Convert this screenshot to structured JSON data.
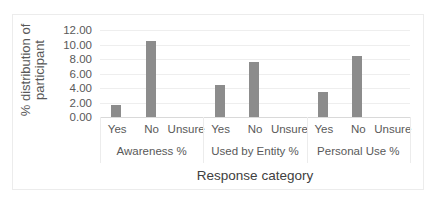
{
  "chart_data": {
    "type": "bar",
    "title": "",
    "xlabel": "Response category",
    "ylabel": "% distribution of participant",
    "ylim": [
      0,
      12
    ],
    "yticks": [
      "0.00",
      "2.00",
      "4.00",
      "6.00",
      "8.00",
      "10.00",
      "12.00"
    ],
    "grid": true,
    "legend": null,
    "groups": [
      "Awareness %",
      "Used by Entity %",
      "Personal Use %"
    ],
    "categories": [
      "Yes",
      "No",
      "Unsure",
      "Yes",
      "No",
      "Unsure",
      "Yes",
      "No",
      "Unsure"
    ],
    "values": [
      1.6,
      10.5,
      0,
      4.4,
      7.6,
      0,
      3.5,
      8.4,
      0
    ],
    "bar_color": "#8c8c8c"
  },
  "labels": {
    "ylabel_line1": "% distribution of",
    "ylabel_line2": "participant",
    "xlabel": "Response category",
    "groups": [
      "Awareness %",
      "Used by Entity %",
      "Personal Use %"
    ],
    "categories": [
      "Yes",
      "No",
      "Unsure",
      "Yes",
      "No",
      "Unsure",
      "Yes",
      "No",
      "Unsure"
    ],
    "yticks": [
      "0.00",
      "2.00",
      "4.00",
      "6.00",
      "8.00",
      "10.00",
      "12.00"
    ]
  }
}
